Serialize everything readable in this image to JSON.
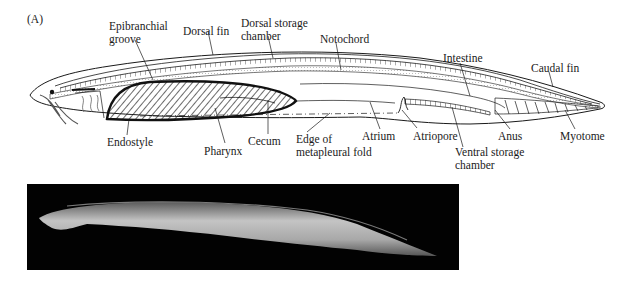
{
  "figure": {
    "panel_label": "(A)"
  },
  "labels": {
    "epibranchial_groove": [
      "Epibranchial",
      "groove"
    ],
    "dorsal_fin": "Dorsal fin",
    "dorsal_storage_chamber": [
      "Dorsal storage",
      "chamber"
    ],
    "notochord": "Notochord",
    "intestine": "Intestine",
    "caudal_fin": "Caudal fin",
    "endostyle": "Endostyle",
    "pharynx": "Pharynx",
    "cecum": "Cecum",
    "metapleural_fold": [
      "Edge of",
      "metapleural fold"
    ],
    "atrium": "Atrium",
    "atriopore": "Atriopore",
    "ventral_storage_chamber": [
      "Ventral storage",
      "chamber"
    ],
    "anus": "Anus",
    "myotome": "Myotome"
  },
  "photo": {
    "description": "Photograph of a lancelet on a black background"
  },
  "colors": {
    "line": "#1a1a1a",
    "background": "#ffffff",
    "photo_bg": "#020202",
    "animal_body": "#b8b8b8"
  }
}
